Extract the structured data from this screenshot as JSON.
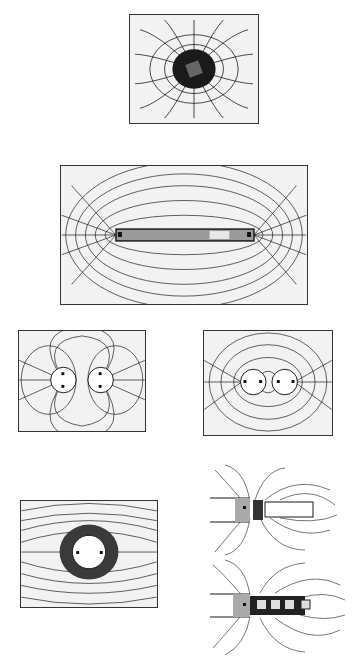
{
  "figure": {
    "type": "iron-filings magnetic field illustrations",
    "colors": {
      "ink": "#1a1a1a",
      "paper": "#f2f2f2",
      "magnet": "#bdbdbd",
      "pole": "#ffffff"
    },
    "panels": [
      {
        "id": "single-pole",
        "desc": "Field around a single magnet pole viewed end-on (dense dark center)"
      },
      {
        "id": "bar-magnet",
        "desc": "Field lines around a horizontal bar magnet"
      },
      {
        "id": "like-poles",
        "desc": "Two circular poles side by side, repelling pattern"
      },
      {
        "id": "unlike-poles",
        "desc": "Two circular poles side by side, attracting pattern"
      },
      {
        "id": "pole-uniform-field",
        "desc": "Single circular pole in a uniform horizontal field"
      },
      {
        "id": "magnet-with-bar",
        "desc": "Magnet end with an iron bar attached"
      },
      {
        "id": "magnet-with-blocks",
        "desc": "Magnet end with a chain of small iron blocks"
      }
    ]
  }
}
